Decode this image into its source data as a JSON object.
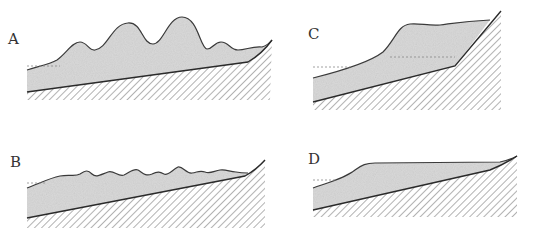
{
  "figure": {
    "panels": [
      {
        "id": "A",
        "label": "A",
        "description": "Multiple large rounded mounds on sloping bedrock"
      },
      {
        "id": "B",
        "label": "B",
        "description": "Many small regular undulations on sloping bedrock"
      },
      {
        "id": "C",
        "label": "C",
        "description": "Single thick deposit banked against steep slope"
      },
      {
        "id": "D",
        "label": "D",
        "description": "Smooth flat-topped deposit on sloping bedrock"
      }
    ],
    "colors": {
      "deposit_fill": "#d9d9d9",
      "outline": "#3a3a3a",
      "hatch": "#555555",
      "background": "#ffffff"
    }
  }
}
